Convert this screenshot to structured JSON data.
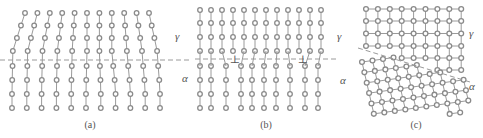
{
  "figure": {
    "atom_stroke": "#8a8a8a",
    "bond_stroke": "#9a9a9a",
    "interface_stroke": "#9a9a9a",
    "panels": [
      {
        "id": "a",
        "caption": "(a)",
        "caption_pos": [
          90,
          128
        ],
        "phase_top_label": "γ",
        "phase_top_pos": [
          175,
          40
        ],
        "phase_bottom_label": "α",
        "phase_bottom_pos": [
          182,
          82
        ],
        "description": "Tilted columns: γ atomic planes above interface bend into α below (shear transformation)",
        "interface": {
          "x1": 0,
          "y1": 60,
          "x2": 190,
          "y2": 60
        }
      },
      {
        "id": "b",
        "caption": "(b)",
        "caption_pos": [
          266,
          128
        ],
        "phase_top_label": "γ",
        "phase_top_pos": [
          337,
          40
        ],
        "phase_bottom_label": "α",
        "phase_bottom_pos": [
          340,
          84
        ],
        "description": "Semi-coherent interface with misfit dislocations",
        "dislocation_symbol": "⊥",
        "dislocations_x": [
          235,
          303
        ],
        "interface": {
          "x1": 195,
          "y1": 59,
          "x2": 336,
          "y2": 59
        }
      },
      {
        "id": "c",
        "caption": "(c)",
        "caption_pos": [
          416,
          128
        ],
        "phase_top_label": "γ",
        "phase_top_pos": [
          469,
          37
        ],
        "phase_bottom_label": "α",
        "phase_bottom_pos": [
          469,
          90
        ],
        "description": "Square γ lattice above inclined interface, rotated denser α lattice below",
        "interface": {
          "x1": 358,
          "y1": 48,
          "x2": 470,
          "y2": 82
        }
      }
    ]
  }
}
